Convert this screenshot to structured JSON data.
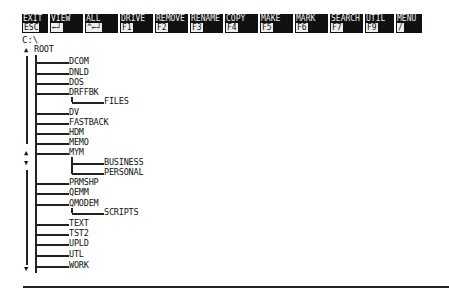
{
  "menu": [
    {
      "label": "EXIT",
      "key": "ESC",
      "width": 26
    },
    {
      "label": "VIEW",
      "key": "←┘",
      "width": 33
    },
    {
      "label": "ALL",
      "key": "^←┘",
      "width": 33
    },
    {
      "label": "DRIVE",
      "key": "F1",
      "width": 33
    },
    {
      "label": "REMOVE",
      "key": "F2",
      "width": 33
    },
    {
      "label": "RENAME",
      "key": "F3",
      "width": 33
    },
    {
      "label": "COPY",
      "key": "F4",
      "width": 33
    },
    {
      "label": "MAKE",
      "key": "F5",
      "width": 33
    },
    {
      "label": "MARK",
      "key": "F6",
      "width": 33
    },
    {
      "label": "SEARCH",
      "key": "F7",
      "width": 33
    },
    {
      "label": "UTIL",
      "key": "F9",
      "width": 29
    },
    {
      "label": "MENU",
      "key": "/",
      "width": 26
    }
  ],
  "current_path": "C:\\",
  "tree": {
    "root": "ROOT",
    "children": [
      {
        "name": "DCOM"
      },
      {
        "name": "DNLD"
      },
      {
        "name": "DOS"
      },
      {
        "name": "DRFFBK",
        "children": [
          {
            "name": "FILES"
          }
        ]
      },
      {
        "name": "DV"
      },
      {
        "name": "FASTBACK"
      },
      {
        "name": "HDM"
      },
      {
        "name": "MEMO"
      },
      {
        "name": "MYM",
        "children": [
          {
            "name": "BUSINESS"
          },
          {
            "name": "PERSONAL"
          }
        ]
      },
      {
        "name": "PRMSHP"
      },
      {
        "name": "QEMM"
      },
      {
        "name": "QMODEM",
        "children": [
          {
            "name": "SCRIPTS"
          }
        ]
      },
      {
        "name": "TEXT"
      },
      {
        "name": "TST2"
      },
      {
        "name": "UPLD"
      },
      {
        "name": "UTL"
      },
      {
        "name": "WORK"
      }
    ]
  },
  "scroll": {
    "up": "▲",
    "down": "▼"
  }
}
